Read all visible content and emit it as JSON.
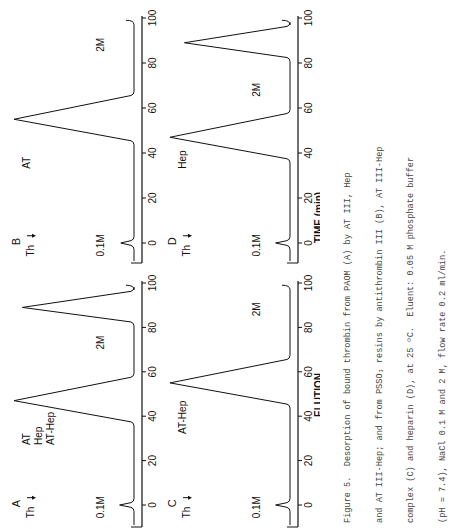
{
  "figure": {
    "caption_lines": [
      "Figure 5.  Desorption of bound thrombin from PAOM (A) by AT III, Hep",
      "and AT III-Hep; and from PSSO₃ resins by antithrombin III (B), AT III-Hep",
      "complex (C) and heparin (D), at 25 ºC.  Eluent: 0.05 M phosphate buffer",
      "(pH = 7.4), NaCl 0.1 M and 2 M, flow rate 0.2 ml/min."
    ],
    "xlabel_left": "ELUTION",
    "xlabel_right": "TIME (min)"
  },
  "chart_data": [
    {
      "type": "line",
      "panel": "A",
      "xlabel": "ELUTION",
      "xticks": [
        0,
        20,
        40,
        60,
        80,
        100
      ],
      "xlim": [
        -8,
        100
      ],
      "annotations": [
        {
          "text": "Th",
          "x": -5
        },
        {
          "text": "0.1M",
          "x": -3
        },
        {
          "text": "AT",
          "x": 27
        },
        {
          "text": "Hep",
          "x": 27
        },
        {
          "text": "AT-Hep",
          "x": 27
        },
        {
          "text": "2M",
          "x": 70
        }
      ],
      "peaks": [
        {
          "x": 0,
          "height": 0.12
        },
        {
          "x": 47,
          "height": 1.0
        },
        {
          "x": 89,
          "height": 0.93
        }
      ]
    },
    {
      "type": "line",
      "panel": "B",
      "xlabel": "",
      "xticks": [
        0,
        20,
        40,
        60,
        80,
        100
      ],
      "xlim": [
        -8,
        100
      ],
      "annotations": [
        {
          "text": "Th",
          "x": -5
        },
        {
          "text": "0.1M",
          "x": -3
        },
        {
          "text": "AT",
          "x": 33
        },
        {
          "text": "2M",
          "x": 85
        }
      ],
      "peaks": [
        {
          "x": 0,
          "height": 0.11
        },
        {
          "x": 55,
          "height": 1.0
        }
      ]
    },
    {
      "type": "line",
      "panel": "C",
      "xlabel": "ELUTION",
      "xticks": [
        0,
        20,
        40,
        60,
        80,
        100
      ],
      "xlim": [
        -8,
        100
      ],
      "annotations": [
        {
          "text": "Th",
          "x": -5
        },
        {
          "text": "0.1M",
          "x": -3
        },
        {
          "text": "AT-Hep",
          "x": 32
        },
        {
          "text": "2M",
          "x": 85
        }
      ],
      "peaks": [
        {
          "x": 0,
          "height": 0.12
        },
        {
          "x": 55,
          "height": 1.0
        }
      ]
    },
    {
      "type": "line",
      "panel": "D",
      "xlabel": "TIME (min)",
      "xticks": [
        0,
        20,
        40,
        60,
        80,
        100
      ],
      "xlim": [
        -8,
        100
      ],
      "annotations": [
        {
          "text": "Th",
          "x": -5
        },
        {
          "text": "0.1M",
          "x": -3
        },
        {
          "text": "Hep",
          "x": 33
        },
        {
          "text": "2M",
          "x": 65
        }
      ],
      "peaks": [
        {
          "x": 0,
          "height": 0.12
        },
        {
          "x": 47,
          "height": 1.0
        },
        {
          "x": 89,
          "height": 0.88
        }
      ]
    }
  ]
}
